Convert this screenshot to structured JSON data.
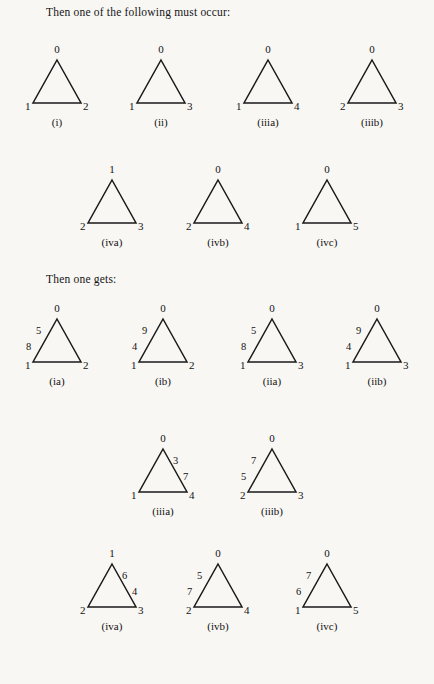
{
  "headings": {
    "first": "Then one of the following must occur:",
    "second": "Then one gets:"
  },
  "figures": [
    {
      "id": "i",
      "caption": "(i)",
      "apex": "0",
      "bottom_left": "1",
      "bottom_right": "2",
      "edge_labels": {},
      "x": 9,
      "y": 44
    },
    {
      "id": "ii",
      "caption": "(ii)",
      "apex": "0",
      "bottom_left": "1",
      "bottom_right": "3",
      "edge_labels": {},
      "x": 113,
      "y": 44
    },
    {
      "id": "iiia",
      "caption": "(iiia)",
      "apex": "0",
      "bottom_left": "1",
      "bottom_right": "4",
      "edge_labels": {},
      "x": 220,
      "y": 44
    },
    {
      "id": "iiib",
      "caption": "(iiib)",
      "apex": "0",
      "bottom_left": "2",
      "bottom_right": "3",
      "edge_labels": {},
      "x": 324,
      "y": 44
    },
    {
      "id": "iva",
      "caption": "(iva)",
      "apex": "1",
      "bottom_left": "2",
      "bottom_right": "3",
      "edge_labels": {},
      "x": 64,
      "y": 164
    },
    {
      "id": "ivb",
      "caption": "(ivb)",
      "apex": "0",
      "bottom_left": "2",
      "bottom_right": "4",
      "edge_labels": {},
      "x": 170,
      "y": 164
    },
    {
      "id": "ivc",
      "caption": "(ivc)",
      "apex": "0",
      "bottom_left": "1",
      "bottom_right": "5",
      "edge_labels": {},
      "x": 279,
      "y": 164
    },
    {
      "id": "ia",
      "caption": "(ia)",
      "apex": "0",
      "bottom_left": "1",
      "bottom_right": "2",
      "edge_labels": {
        "left_top": "5",
        "left_bottom": "8"
      },
      "x": 9,
      "y": 303
    },
    {
      "id": "ib",
      "caption": "(ib)",
      "apex": "0",
      "bottom_left": "1",
      "bottom_right": "2",
      "edge_labels": {
        "left_top": "9",
        "left_bottom": "4"
      },
      "x": 115,
      "y": 303
    },
    {
      "id": "iia",
      "caption": "(iia)",
      "apex": "0",
      "bottom_left": "1",
      "bottom_right": "3",
      "edge_labels": {
        "left_top": "5",
        "left_bottom": "8"
      },
      "x": 224,
      "y": 303
    },
    {
      "id": "iib",
      "caption": "(iib)",
      "apex": "0",
      "bottom_left": "1",
      "bottom_right": "3",
      "edge_labels": {
        "left_top": "9",
        "left_bottom": "4"
      },
      "x": 329,
      "y": 303
    },
    {
      "id": "iiia2",
      "caption": "(iiia)",
      "apex": "0",
      "bottom_left": "1",
      "bottom_right": "4",
      "edge_labels": {
        "right_top": "3",
        "right_bottom": "7"
      },
      "x": 115,
      "y": 433
    },
    {
      "id": "iiib2",
      "caption": "(iiib)",
      "apex": "0",
      "bottom_left": "2",
      "bottom_right": "3",
      "edge_labels": {
        "left_top": "7",
        "left_bottom": "5"
      },
      "x": 224,
      "y": 433
    },
    {
      "id": "iva2",
      "caption": "(iva)",
      "apex": "1",
      "bottom_left": "2",
      "bottom_right": "3",
      "edge_labels": {
        "right_top": "6",
        "right_bottom": "4"
      },
      "x": 64,
      "y": 548
    },
    {
      "id": "ivb2",
      "caption": "(ivb)",
      "apex": "0",
      "bottom_left": "2",
      "bottom_right": "4",
      "edge_labels": {
        "left_top": "5",
        "left_bottom": "7"
      },
      "x": 170,
      "y": 548
    },
    {
      "id": "ivc2",
      "caption": "(ivc)",
      "apex": "0",
      "bottom_left": "1",
      "bottom_right": "5",
      "edge_labels": {
        "left_top": "7",
        "left_bottom": "6"
      },
      "x": 279,
      "y": 548
    }
  ],
  "style": {
    "stroke_color": "#1a1a1a",
    "background": "#f8f7f4"
  }
}
